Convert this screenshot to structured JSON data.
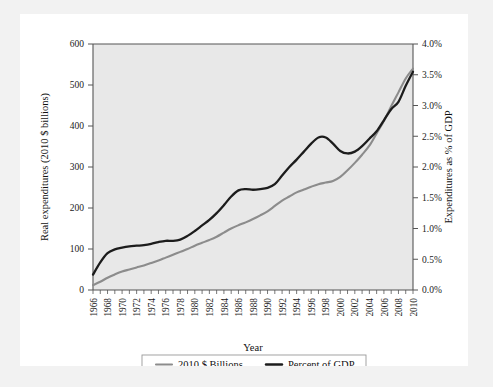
{
  "chart_data": {
    "type": "line",
    "title": "",
    "xlabel": "Year",
    "ylabel": "Real expenditures (2010 $ billions)",
    "y2label": "Expenditures as % of GDP",
    "grid": false,
    "legend_position": "bottom",
    "xlim": [
      1966,
      2010
    ],
    "ylim": [
      0,
      600
    ],
    "y2lim": [
      0,
      4.0
    ],
    "yticks": [
      "0",
      "100",
      "200",
      "300",
      "400",
      "500",
      "600"
    ],
    "ytick_values": [
      0,
      100,
      200,
      300,
      400,
      500,
      600
    ],
    "y2ticks": [
      "0.0%",
      "0.5%",
      "1.0%",
      "1.5%",
      "2.0%",
      "2.5%",
      "3.0%",
      "3.5%",
      "4.0%"
    ],
    "y2tick_values": [
      0,
      0.5,
      1.0,
      1.5,
      2.0,
      2.5,
      3.0,
      3.5,
      4.0
    ],
    "xticks": [
      "1966",
      "1968",
      "1970",
      "1972",
      "1974",
      "1976",
      "1978",
      "1980",
      "1982",
      "1984",
      "1986",
      "1988",
      "1990",
      "1992",
      "1994",
      "1996",
      "1998",
      "2000",
      "2002",
      "2004",
      "2006",
      "2008",
      "2010"
    ],
    "x": [
      1966,
      1967,
      1968,
      1969,
      1970,
      1971,
      1972,
      1973,
      1974,
      1975,
      1976,
      1977,
      1978,
      1979,
      1980,
      1981,
      1982,
      1983,
      1984,
      1985,
      1986,
      1987,
      1988,
      1989,
      1990,
      1991,
      1992,
      1993,
      1994,
      1995,
      1996,
      1997,
      1998,
      1999,
      2000,
      2001,
      2002,
      2003,
      2004,
      2005,
      2006,
      2007,
      2008,
      2009,
      2010
    ],
    "series": [
      {
        "name": "2010 $ Billions",
        "color": "#8c8c8c",
        "axis": "left",
        "values": [
          12,
          20,
          30,
          38,
          45,
          50,
          55,
          60,
          66,
          72,
          79,
          86,
          93,
          100,
          108,
          115,
          122,
          130,
          140,
          150,
          158,
          165,
          173,
          182,
          192,
          205,
          218,
          228,
          238,
          245,
          252,
          258,
          262,
          266,
          276,
          292,
          310,
          330,
          352,
          382,
          412,
          448,
          482,
          516,
          540
        ]
      },
      {
        "name": "Percent of GDP",
        "color": "#1c1c1c",
        "axis": "right",
        "values": [
          0.25,
          0.45,
          0.6,
          0.66,
          0.69,
          0.71,
          0.72,
          0.73,
          0.75,
          0.78,
          0.8,
          0.8,
          0.82,
          0.88,
          0.96,
          1.05,
          1.14,
          1.25,
          1.38,
          1.52,
          1.62,
          1.64,
          1.63,
          1.64,
          1.66,
          1.72,
          1.86,
          2.0,
          2.12,
          2.25,
          2.38,
          2.48,
          2.48,
          2.38,
          2.26,
          2.22,
          2.25,
          2.34,
          2.46,
          2.58,
          2.76,
          2.94,
          3.06,
          3.32,
          3.55
        ]
      }
    ],
    "legend": [
      {
        "label": "2010 $ Billions",
        "color": "#8c8c8c"
      },
      {
        "label": "Percent of GDP",
        "color": "#1c1c1c"
      }
    ]
  },
  "colors": {
    "page_background": "#f2f2f2",
    "card_background": "#ffffff",
    "plot_background": "#e8e8e8",
    "axis": "#555555",
    "series_billions": "#8c8c8c",
    "series_gdp": "#1c1c1c"
  }
}
